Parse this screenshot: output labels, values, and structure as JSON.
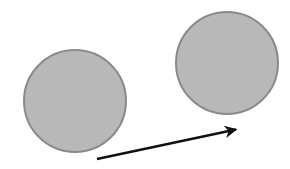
{
  "diagram": {
    "background": "#ffffff",
    "circles": [
      {
        "id": "left-circle",
        "cx": 75,
        "cy": 101,
        "r": 51,
        "fill": "#b8b8b8",
        "stroke": "#8a8a8a"
      },
      {
        "id": "right-circle",
        "cx": 227,
        "cy": 63,
        "r": 51,
        "fill": "#b8b8b8",
        "stroke": "#8a8a8a"
      }
    ],
    "arrow": {
      "x1": 97,
      "y1": 159,
      "x2": 238,
      "y2": 129,
      "color": "#111111"
    }
  }
}
